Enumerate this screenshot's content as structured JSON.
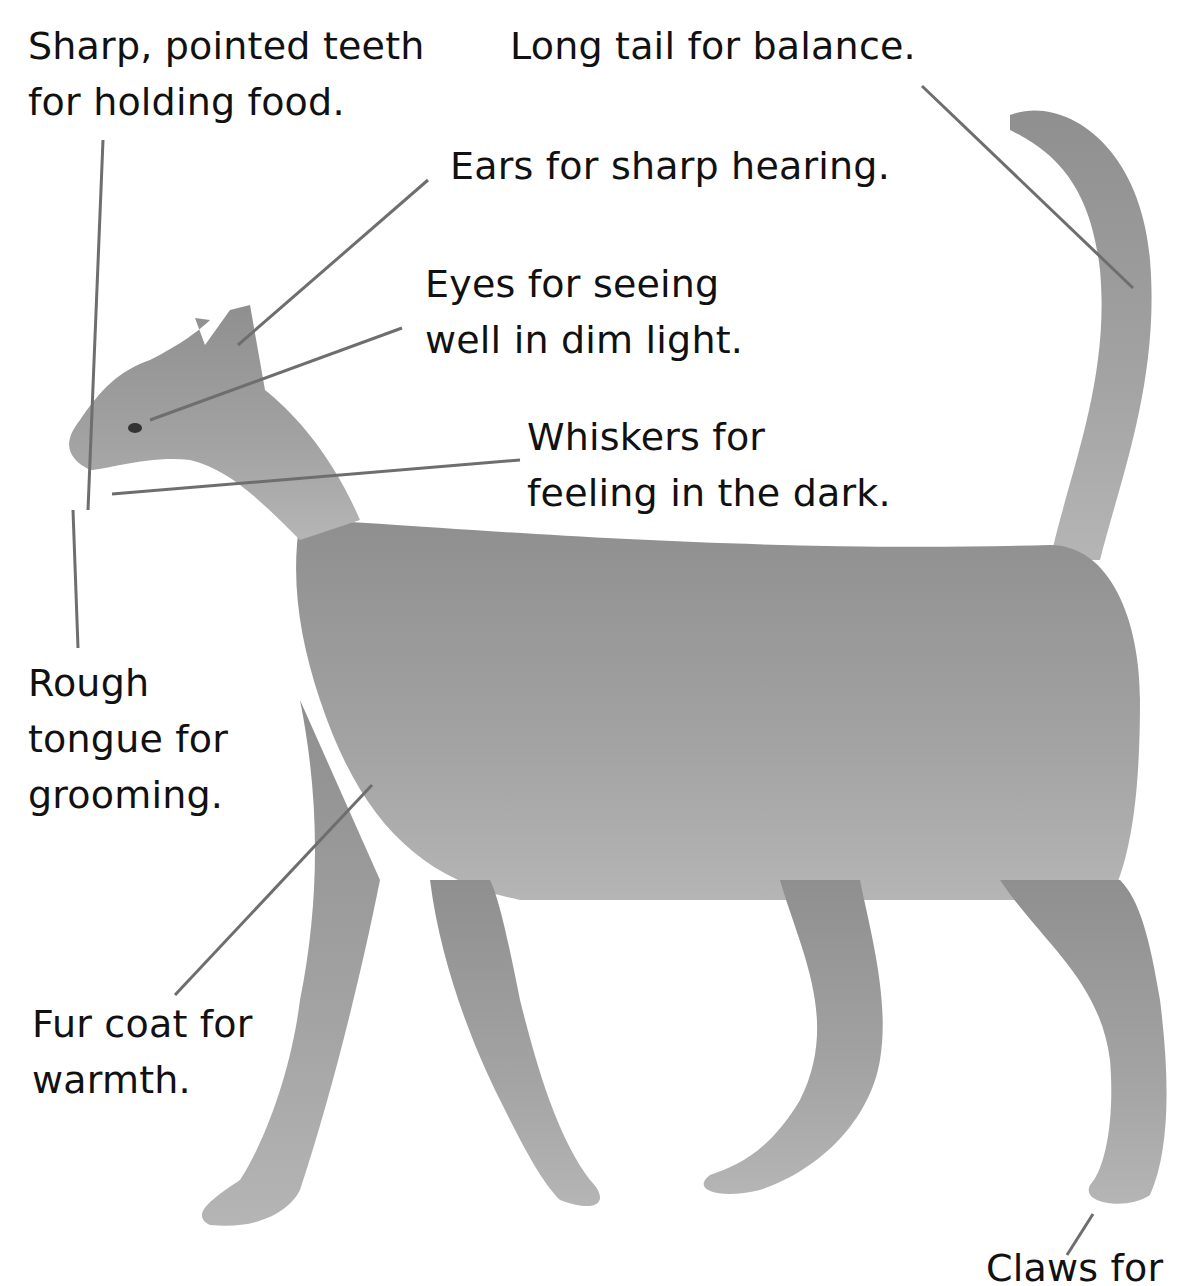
{
  "diagram": {
    "colors": {
      "background": "#ffffff",
      "text": "#111111",
      "leader_line": "#6e6e6e",
      "cat_fur": "#9a9a9a"
    },
    "labels": [
      {
        "id": "teeth",
        "lines": [
          "Sharp, pointed teeth",
          "for holding food."
        ]
      },
      {
        "id": "tail",
        "lines": [
          "Long tail for balance."
        ]
      },
      {
        "id": "ears",
        "lines": [
          "Ears for sharp hearing."
        ]
      },
      {
        "id": "eyes",
        "lines": [
          "Eyes for seeing",
          "well in dim light."
        ]
      },
      {
        "id": "whiskers",
        "lines": [
          "Whiskers for",
          "feeling in the dark."
        ]
      },
      {
        "id": "tongue",
        "lines": [
          "Rough",
          "tongue for",
          "grooming."
        ]
      },
      {
        "id": "fur",
        "lines": [
          "Fur coat for",
          "warmth."
        ]
      },
      {
        "id": "claws",
        "lines": [
          "Claws for"
        ]
      }
    ]
  }
}
